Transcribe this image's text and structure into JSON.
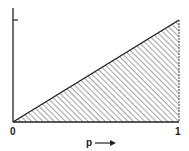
{
  "diagram": {
    "type": "triangle-region",
    "x_axis": {
      "label": "p",
      "arrow": "right-arrow",
      "tick_labels": [
        "0",
        "1"
      ],
      "range": [
        0,
        1
      ]
    },
    "y_axis": {
      "tick_labels": [],
      "ticks": 1
    },
    "region": {
      "shape": "triangle",
      "vertices": [
        [
          0,
          0
        ],
        [
          1,
          0
        ],
        [
          1,
          1
        ]
      ],
      "fill": "diagonal-hatch",
      "hatch_direction": "descending"
    },
    "colors": {
      "line": "#222222",
      "hatch": "#555555",
      "background": "#ffffff"
    }
  }
}
